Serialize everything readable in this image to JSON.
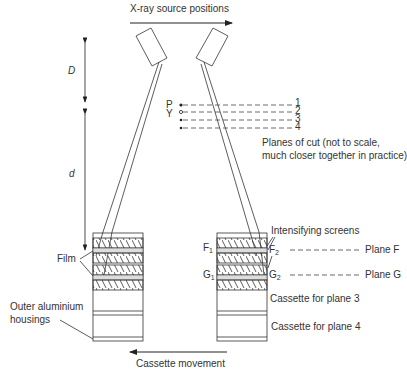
{
  "title": "X-ray source positions",
  "dimensions": {
    "upper": "D",
    "lower": "d"
  },
  "points": {
    "p": "P",
    "y": "Y"
  },
  "plane_numbers": [
    "1",
    "2",
    "3",
    "4"
  ],
  "planes_note_line1": "Planes of cut (not to scale,",
  "planes_note_line2": "much closer together in practice)",
  "left_labels": {
    "film": "Film",
    "housing_line1": "Outer aluminium",
    "housing_line2": "housings"
  },
  "right_labels": {
    "intensifying": "Intensifying screens",
    "f1": "F",
    "f1_sub": "1",
    "f2": "F",
    "f2_sub": "2",
    "g1": "G",
    "g1_sub": "1",
    "g2": "G",
    "g2_sub": "2",
    "plane_f": "Plane F",
    "plane_g": "Plane G",
    "cassette3": "Cassette for plane 3",
    "cassette4": "Cassette for plane 4"
  },
  "movement": "Cassette movement"
}
